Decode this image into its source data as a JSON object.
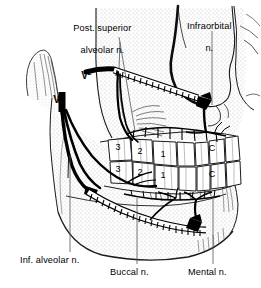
{
  "figure": {
    "background_color": "#ffffff",
    "ink_color": "#000000",
    "width": 261,
    "height": 288
  },
  "labels": {
    "post_superior_alveolar": {
      "line1": "Post. superior",
      "line2": "alveolar n.",
      "x": 60,
      "y": 12
    },
    "infraorbital": {
      "line1": "Infraorbital",
      "line2": "n.",
      "x": 172,
      "y": 10
    },
    "inf_alveolar": {
      "text": "Inf. alveolar n.",
      "x": 24,
      "y": 258
    },
    "buccal": {
      "text": "Buccal n.",
      "x": 112,
      "y": 270
    },
    "mental": {
      "text": "Mental n.",
      "x": 190,
      "y": 270
    }
  },
  "division_labels": {
    "maxillary": {
      "base": "V",
      "superscript": "2",
      "x": 72,
      "y": 60
    },
    "mandibular": {
      "base": "V",
      "superscript": "3",
      "x": 44,
      "y": 84
    }
  },
  "teeth": {
    "upper_row": [
      {
        "label": "3",
        "x": 118,
        "y": 147
      },
      {
        "label": "2",
        "x": 140,
        "y": 152
      },
      {
        "label": "1",
        "x": 163,
        "y": 155
      },
      {
        "label": "C",
        "x": 212,
        "y": 148
      }
    ],
    "lower_row": [
      {
        "label": "3",
        "x": 118,
        "y": 168
      },
      {
        "label": "2",
        "x": 140,
        "y": 172
      },
      {
        "label": "1",
        "x": 163,
        "y": 175
      },
      {
        "label": "C",
        "x": 212,
        "y": 175
      }
    ]
  },
  "colors": {
    "ink": "#000000",
    "background": "#ffffff",
    "stipple": "#8a8a8a",
    "hatch": "#333333"
  }
}
